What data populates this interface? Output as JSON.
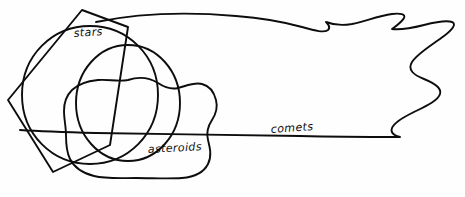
{
  "diagram": {
    "background_color": "#fefefe",
    "stroke_color": "#0d0d0d",
    "stroke_width": 1.9,
    "width": 465,
    "height": 197,
    "labels": [
      {
        "id": "stars",
        "text": "stars",
        "x": 74,
        "y": 37,
        "rotation": -4
      },
      {
        "id": "asteroids",
        "text": "asteroids",
        "x": 148,
        "y": 153,
        "rotation": -3
      },
      {
        "id": "comets",
        "text": "comets",
        "x": 271,
        "y": 133,
        "rotation": -4
      }
    ],
    "shapes": [
      {
        "id": "square",
        "kind": "rotated-square",
        "label_for": "stars"
      },
      {
        "id": "circle-left",
        "kind": "circle",
        "label_for": "stars"
      },
      {
        "id": "circle-right",
        "kind": "circle",
        "label_for": "stars"
      },
      {
        "id": "asteroids-blob",
        "kind": "irregular-blob",
        "label_for": "asteroids"
      },
      {
        "id": "comets-region",
        "kind": "comet-region",
        "label_for": "comets"
      }
    ]
  }
}
